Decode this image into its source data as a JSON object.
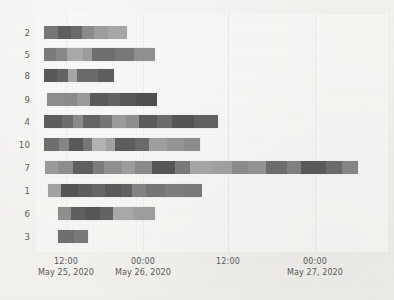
{
  "chart_data": {
    "type": "bar",
    "subtype": "gantt-timeline-stacked",
    "title": "",
    "xlabel": "",
    "ylabel": "",
    "grid": false,
    "legend": null,
    "orientation": "horizontal",
    "x_axis": {
      "type": "datetime",
      "range_start": "May 25, 2020 06:30",
      "range_end": "May 27, 2020 11:00",
      "unit_hours_per_px": 0.1558,
      "tick_labels": [
        {
          "time": "12:00",
          "date": "May 25, 2020",
          "x_px": 66
        },
        {
          "time": "00:00",
          "date": "May 26, 2020",
          "x_px": 143
        },
        {
          "time": "12:00",
          "date": "",
          "x_px": 228
        },
        {
          "time": "00:00",
          "date": "May 27, 2020",
          "x_px": 315
        }
      ]
    },
    "y_axis": {
      "categories": [
        "2",
        "5",
        "8",
        "9",
        "4",
        "10",
        "7",
        "1",
        "6",
        "3"
      ]
    },
    "colors": {
      "background": "#f2f1ee",
      "plot_background": "#faf9f7",
      "palette": [
        "#7f7f7f",
        "#8c8c8c",
        "#6e6e6e",
        "#5a5a5a",
        "#a3a3a3",
        "#999999",
        "#656565",
        "#b0b0b0",
        "#747474",
        "#8a8a8a"
      ]
    },
    "rows": [
      {
        "label": "2",
        "y_px": 26,
        "start_px": 44,
        "end_px": 127,
        "segments": [
          {
            "w": 14,
            "color": "#757575"
          },
          {
            "w": 13,
            "color": "#5e5e5e"
          },
          {
            "w": 11,
            "color": "#6b6b6b"
          },
          {
            "w": 12,
            "color": "#8b8b8b"
          },
          {
            "w": 14,
            "color": "#9d9d9d"
          },
          {
            "w": 19,
            "color": "#a6a6a6"
          }
        ]
      },
      {
        "label": "5",
        "y_px": 48,
        "start_px": 44,
        "end_px": 155,
        "segments": [
          {
            "w": 12,
            "color": "#7b7b7b"
          },
          {
            "w": 11,
            "color": "#878787"
          },
          {
            "w": 16,
            "color": "#a8a8a8"
          },
          {
            "w": 9,
            "color": "#9b9b9b"
          },
          {
            "w": 23,
            "color": "#6f6f6f"
          },
          {
            "w": 19,
            "color": "#787878"
          },
          {
            "w": 21,
            "color": "#8f8f8f"
          }
        ]
      },
      {
        "label": "8",
        "y_px": 69,
        "start_px": 44,
        "end_px": 114,
        "segments": [
          {
            "w": 13,
            "color": "#585858"
          },
          {
            "w": 11,
            "color": "#636363"
          },
          {
            "w": 9,
            "color": "#a5a5a5"
          },
          {
            "w": 21,
            "color": "#6a6a6a"
          },
          {
            "w": 16,
            "color": "#5f5f5f"
          }
        ]
      },
      {
        "label": "9",
        "y_px": 93,
        "start_px": 47,
        "end_px": 157,
        "segments": [
          {
            "w": 17,
            "color": "#8d8d8d"
          },
          {
            "w": 13,
            "color": "#8a8a8a"
          },
          {
            "w": 13,
            "color": "#999999"
          },
          {
            "w": 18,
            "color": "#5b5b5b"
          },
          {
            "w": 12,
            "color": "#636363"
          },
          {
            "w": 16,
            "color": "#585858"
          },
          {
            "w": 21,
            "color": "#505050"
          }
        ]
      },
      {
        "label": "4",
        "y_px": 115,
        "start_px": 44,
        "end_px": 218,
        "segments": [
          {
            "w": 18,
            "color": "#5d5d5d"
          },
          {
            "w": 11,
            "color": "#6c6c6c"
          },
          {
            "w": 10,
            "color": "#8b8b8b"
          },
          {
            "w": 17,
            "color": "#646464"
          },
          {
            "w": 12,
            "color": "#757575"
          },
          {
            "w": 14,
            "color": "#9a9a9a"
          },
          {
            "w": 13,
            "color": "#8e8e8e"
          },
          {
            "w": 18,
            "color": "#5a5a5a"
          },
          {
            "w": 15,
            "color": "#6b6b6b"
          },
          {
            "w": 22,
            "color": "#555555"
          },
          {
            "w": 24,
            "color": "#606060"
          }
        ]
      },
      {
        "label": "10",
        "y_px": 138,
        "start_px": 44,
        "end_px": 200,
        "segments": [
          {
            "w": 15,
            "color": "#6e6e6e"
          },
          {
            "w": 10,
            "color": "#858585"
          },
          {
            "w": 14,
            "color": "#595959"
          },
          {
            "w": 9,
            "color": "#777777"
          },
          {
            "w": 14,
            "color": "#b2b2b2"
          },
          {
            "w": 9,
            "color": "#a0a0a0"
          },
          {
            "w": 20,
            "color": "#5c5c5c"
          },
          {
            "w": 14,
            "color": "#6a6a6a"
          },
          {
            "w": 18,
            "color": "#9e9e9e"
          },
          {
            "w": 17,
            "color": "#949494"
          },
          {
            "w": 16,
            "color": "#8c8c8c"
          }
        ]
      },
      {
        "label": "7",
        "y_px": 161,
        "start_px": 45,
        "end_px": 358,
        "segments": [
          {
            "w": 13,
            "color": "#9a9a9a"
          },
          {
            "w": 15,
            "color": "#8d8d8d"
          },
          {
            "w": 20,
            "color": "#5f5f5f"
          },
          {
            "w": 11,
            "color": "#7c7c7c"
          },
          {
            "w": 18,
            "color": "#8f8f8f"
          },
          {
            "w": 13,
            "color": "#9c9c9c"
          },
          {
            "w": 17,
            "color": "#8a8a8a"
          },
          {
            "w": 23,
            "color": "#565656"
          },
          {
            "w": 15,
            "color": "#7a7a7a"
          },
          {
            "w": 22,
            "color": "#a4a4a4"
          },
          {
            "w": 20,
            "color": "#9f9f9f"
          },
          {
            "w": 16,
            "color": "#8b8b8b"
          },
          {
            "w": 18,
            "color": "#929292"
          },
          {
            "w": 21,
            "color": "#6d6d6d"
          },
          {
            "w": 14,
            "color": "#7f7f7f"
          },
          {
            "w": 25,
            "color": "#595959"
          },
          {
            "w": 16,
            "color": "#6b6b6b"
          },
          {
            "w": 16,
            "color": "#848484"
          }
        ]
      },
      {
        "label": "1",
        "y_px": 184,
        "start_px": 48,
        "end_px": 202,
        "segments": [
          {
            "w": 13,
            "color": "#a1a1a1"
          },
          {
            "w": 17,
            "color": "#545454"
          },
          {
            "w": 14,
            "color": "#5d5d5d"
          },
          {
            "w": 13,
            "color": "#666666"
          },
          {
            "w": 16,
            "color": "#5a5a5a"
          },
          {
            "w": 11,
            "color": "#626262"
          },
          {
            "w": 14,
            "color": "#828282"
          },
          {
            "w": 19,
            "color": "#757575"
          },
          {
            "w": 18,
            "color": "#7d7d7d"
          },
          {
            "w": 19,
            "color": "#7a7a7a"
          }
        ]
      },
      {
        "label": "6",
        "y_px": 207,
        "start_px": 58,
        "end_px": 155,
        "segments": [
          {
            "w": 13,
            "color": "#8e8e8e"
          },
          {
            "w": 14,
            "color": "#5e5e5e"
          },
          {
            "w": 15,
            "color": "#565656"
          },
          {
            "w": 13,
            "color": "#636363"
          },
          {
            "w": 20,
            "color": "#a7a7a7"
          },
          {
            "w": 22,
            "color": "#9d9d9d"
          }
        ]
      },
      {
        "label": "3",
        "y_px": 230,
        "start_px": 58,
        "end_px": 88,
        "segments": [
          {
            "w": 16,
            "color": "#6f6f6f"
          },
          {
            "w": 14,
            "color": "#797979"
          }
        ]
      }
    ]
  }
}
